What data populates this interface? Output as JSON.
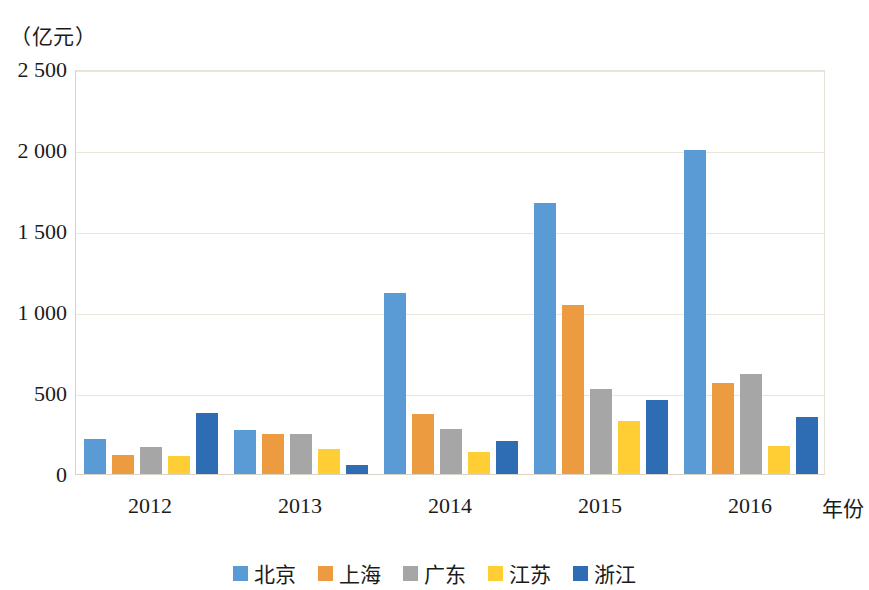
{
  "chart_data": {
    "type": "bar",
    "title": "",
    "subtitle": "",
    "unit_label": "（亿元）",
    "xlabel": "年份",
    "ylabel": "亿元",
    "categories": [
      "2012",
      "2013",
      "2014",
      "2015",
      "2016"
    ],
    "ylim": [
      0,
      2500
    ],
    "yticks": [
      0,
      500,
      1000,
      1500,
      2000,
      2500
    ],
    "ytick_labels": [
      "0",
      "500",
      "1 000",
      "1 500",
      "2 000",
      "2 500"
    ],
    "grid": true,
    "legend_position": "bottom",
    "series": [
      {
        "name": "北京",
        "color": "#5B9BD5",
        "values": [
          215,
          270,
          1115,
          1670,
          2000
        ]
      },
      {
        "name": "上海",
        "color": "#ED9B40",
        "values": [
          120,
          250,
          370,
          1045,
          560
        ]
      },
      {
        "name": "广东",
        "color": "#A6A6A6",
        "values": [
          165,
          250,
          280,
          525,
          615
        ]
      },
      {
        "name": "江苏",
        "color": "#FFCE35",
        "values": [
          112,
          155,
          135,
          325,
          175
        ]
      },
      {
        "name": "浙江",
        "color": "#2E6DB4",
        "values": [
          375,
          55,
          205,
          455,
          350
        ]
      }
    ]
  },
  "colors": {
    "background": "#ffffff",
    "gridline": "#e9e6db",
    "axis": "#d8d4c8",
    "text": "#1b1b1b"
  }
}
